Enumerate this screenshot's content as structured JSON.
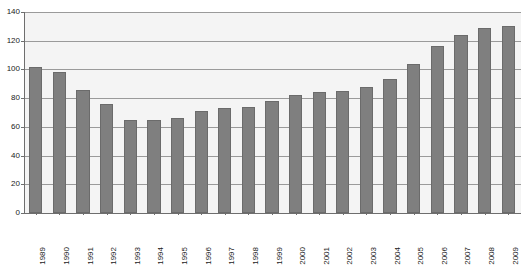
{
  "chart_data": {
    "type": "bar",
    "title": "",
    "xlabel": "",
    "ylabel": "",
    "ylim": [
      0,
      140
    ],
    "yticks": [
      0,
      20,
      40,
      60,
      80,
      100,
      120,
      140
    ],
    "grid": true,
    "legend": "none",
    "bar_color": "#7f7f7f",
    "plot_background": "#f4f4f4",
    "categories": [
      "1989",
      "1990",
      "1991",
      "1992",
      "1993",
      "1994",
      "1995",
      "1996",
      "1997",
      "1998",
      "1999",
      "2000",
      "2001",
      "2002",
      "2003",
      "2004",
      "2005",
      "2006",
      "2007",
      "2008",
      "2009"
    ],
    "values": [
      102,
      98,
      86,
      76,
      65,
      65,
      66,
      71,
      73,
      74,
      78,
      82,
      84,
      85,
      88,
      93,
      104,
      116,
      124,
      129,
      130
    ]
  },
  "caption": {
    "text": ""
  }
}
